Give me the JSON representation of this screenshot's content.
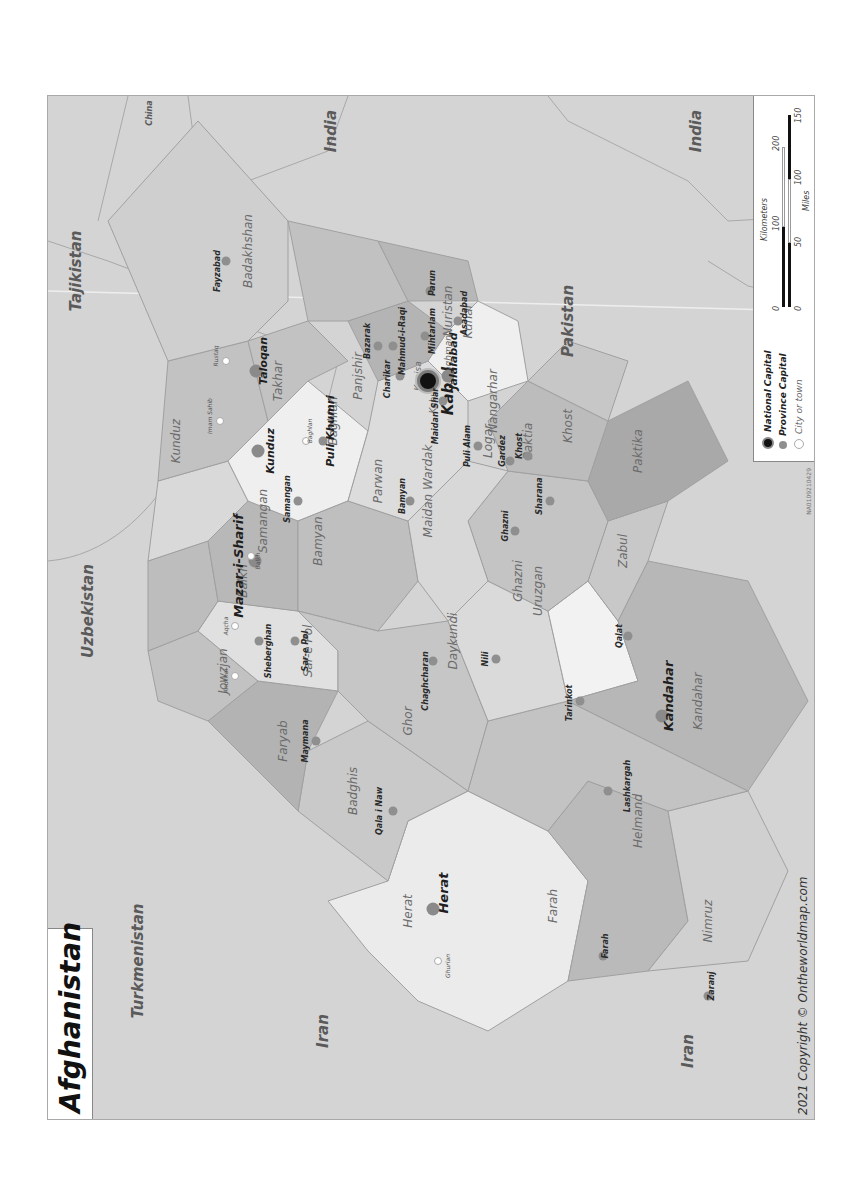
{
  "map": {
    "title": "Afghanistan",
    "copyright": "2021 Copyright © Ontheworldmap.com",
    "map_code": "NA0109210429",
    "orientation": "rotated 90° counter-clockwise",
    "colors": {
      "background": "#d4d4d4",
      "province_light": "#e9e9e9",
      "province_mid": "#c9c9c9",
      "province_dark": "#b3b3b3",
      "border": "#a0a0a0"
    }
  },
  "countries": [
    "Turkmenistan",
    "Uzbekistan",
    "Tajikistan",
    "China",
    "India",
    "India",
    "Pakistan",
    "Iran",
    "Iran"
  ],
  "provinces": [
    "Herat",
    "Badghis",
    "Faryab",
    "Jowzjan",
    "Sar-e Pol",
    "Balkh",
    "Samangan",
    "Kunduz",
    "Takhar",
    "Badakhshan",
    "Baghlan",
    "Bamyan",
    "Ghor",
    "Farah",
    "Nimruz",
    "Helmand",
    "Kandahar",
    "Uruzgan",
    "Daykundi",
    "Ghazni",
    "Zabul",
    "Paktika",
    "Paktia",
    "Khost",
    "Logar",
    "Maidan Wardak",
    "Parwan",
    "Panjshir",
    "Kapisa",
    "Kabul",
    "Laghman",
    "Nuristan",
    "Kunar",
    "Nangarhar"
  ],
  "cities": {
    "national_capital": "Kabul",
    "province_capitals": [
      "Herat",
      "Qala i Naw",
      "Maymana",
      "Sheberghan",
      "Sar-e Pol",
      "Mazar-i-Sharif",
      "Samangan",
      "Kunduz",
      "Taloqan",
      "Fayzabad",
      "Puli Khumri",
      "Bamyan",
      "Chaghcharan",
      "Farah",
      "Zaranj",
      "Lashkargah",
      "Kandahar",
      "Tarinkot",
      "Nili",
      "Ghazni",
      "Qalat",
      "Sharana",
      "Gardez",
      "Khost",
      "Puli Alam",
      "Maidan Shar",
      "Charikar",
      "Bazarak",
      "Mahmud-i-Raqi",
      "Mihtarlam",
      "Parun",
      "Asadabad",
      "Jalalabad"
    ],
    "towns": [
      "Ghurian",
      "Andkhoi",
      "Aqcha",
      "Balkh",
      "Imam Sahib",
      "Rustaq",
      "Baghlan"
    ]
  },
  "legend": {
    "items": [
      {
        "label": "National Capital",
        "color": "#111111"
      },
      {
        "label": "Province Capital",
        "color": "#8f8f8f"
      },
      {
        "label": "City or town",
        "color": "#ffffff"
      }
    ],
    "scale": {
      "km_label": "Kilometers",
      "km_ticks": [
        "0",
        "100",
        "200"
      ],
      "mi_label": "Miles",
      "mi_ticks": [
        "0",
        "50",
        "100",
        "150"
      ]
    }
  }
}
